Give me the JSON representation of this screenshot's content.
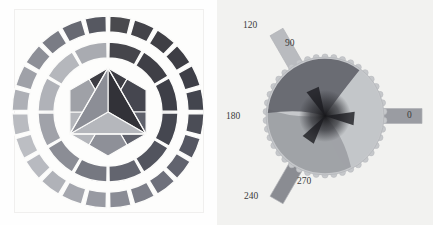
{
  "figure": {
    "title": "",
    "panels": [
      {
        "id": "color-wheel",
        "name": "itten-color-wheel-grayscale",
        "description": "Twelve-part color wheel rendered in grayscale: outer ring of 24 tertiary segments, middle ring of 12 segments, inner hexagon of 6 secondary trapezoids around a central triangle of 3 primaries.",
        "rings": {
          "outer": {
            "segment_count": 24,
            "values": [
              "#4a4a4e",
              "#434349",
              "#3f3f45",
              "#3d3d44",
              "#3e3f47",
              "#43454e",
              "#4b4d56",
              "#555762",
              "#61636e",
              "#6e707b",
              "#7c7e88",
              "#8a8c95",
              "#989aa2",
              "#a5a7ae",
              "#b0b2b8",
              "#b8bac0",
              "#bcbec3",
              "#b9bbc0",
              "#aeb0b6",
              "#9fa1a8",
              "#8d8f97",
              "#7a7c85",
              "#676972",
              "#565861"
            ]
          },
          "middle": {
            "segment_count": 12,
            "values": [
              "#45454b",
              "#3f3f46",
              "#3e3f47",
              "#454750",
              "#52545e",
              "#63656f",
              "#767881",
              "#8b8d95",
              "#a0a2a9",
              "#b0b2b8",
              "#b5b7bc",
              "#a9abb1"
            ]
          },
          "hexagon": {
            "segment_count": 6,
            "values": [
              "#3d3d44",
              "#45464f",
              "#5f616b",
              "#8e9098",
              "#b4b6bb",
              "#9fa1a7"
            ]
          },
          "triangle": {
            "segment_count": 3,
            "values": [
              "#323238",
              "#b5b7bc",
              "#8c8e96"
            ]
          },
          "separator_color": "#fbfbfa"
        }
      },
      {
        "id": "phase-disk",
        "name": "scalloped-phase-disk",
        "description": "Gear-toothed disk with three overlapping lobes converging at the centre, plus three radial rectangular bars at 0, 120 and 240 degrees.",
        "tooth_count": 42,
        "axis_labels": [
          {
            "text": "0",
            "angle_deg": 0,
            "x": 190,
            "y": 116
          },
          {
            "text": "90",
            "angle_deg": 90,
            "x": 68,
            "y": 44
          },
          {
            "text": "120",
            "angle_deg": 120,
            "x": 26,
            "y": 26
          },
          {
            "text": "180",
            "angle_deg": 180,
            "x": 9,
            "y": 117
          },
          {
            "text": "240",
            "angle_deg": 240,
            "x": 27,
            "y": 197
          },
          {
            "text": "270",
            "angle_deg": 270,
            "x": 80,
            "y": 182
          }
        ],
        "bars": [
          {
            "name": "bar-0-degrees",
            "angle_deg": 0,
            "fill": "#9a9ca2"
          },
          {
            "name": "bar-120-degrees",
            "angle_deg": 120,
            "fill": "#b9bbbf"
          },
          {
            "name": "bar-240-degrees",
            "angle_deg": 240,
            "fill": "#8a8c92"
          }
        ],
        "lobes": [
          {
            "name": "lobe-light",
            "fill": "#c3c5c8"
          },
          {
            "name": "lobe-mid",
            "fill": "#9b9da2"
          },
          {
            "name": "lobe-dark",
            "fill": "#5d5f66"
          }
        ],
        "disk_fill": "#c6c8cb",
        "center_fill": "#1c1c20"
      }
    ]
  },
  "chart_data": {
    "type": "pie",
    "charts": [
      {
        "id": "color-wheel",
        "type": "pie",
        "title": "Twelve-part colour wheel (grayscale)",
        "categories": [
          "outer ring (24)",
          "middle ring (12)",
          "hexagon (6)",
          "triangle (3)"
        ],
        "values": [
          24,
          12,
          6,
          3
        ],
        "xlabel": "",
        "ylabel": "",
        "legend": "none",
        "grid": false
      },
      {
        "id": "phase-disk",
        "type": "pie",
        "title": "Phase disk",
        "categories": [
          "0",
          "90",
          "120",
          "180",
          "240",
          "270"
        ],
        "values": [
          0,
          90,
          120,
          180,
          240,
          270
        ],
        "xlabel": "angle (degrees)",
        "ylabel": "",
        "legend": "none",
        "grid": false,
        "annotations": [
          "0",
          "90",
          "120",
          "180",
          "240",
          "270"
        ]
      }
    ]
  }
}
